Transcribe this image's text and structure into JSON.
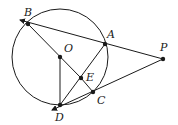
{
  "diagram": {
    "type": "geometry",
    "stroke_color": "#1a1a1a",
    "points": [
      {
        "id": "B",
        "label": "B",
        "x": 28,
        "y": 24,
        "lx": 24,
        "ly": 16
      },
      {
        "id": "O",
        "label": "O",
        "x": 60,
        "y": 57,
        "lx": 64,
        "ly": 52
      },
      {
        "id": "A",
        "label": "A",
        "x": 105,
        "y": 44,
        "lx": 107,
        "ly": 36
      },
      {
        "id": "P",
        "label": "P",
        "x": 163,
        "y": 59,
        "lx": 160,
        "ly": 50
      },
      {
        "id": "E",
        "label": "E",
        "x": 81,
        "y": 78,
        "lx": 87,
        "ly": 80
      },
      {
        "id": "C",
        "label": "C",
        "x": 93,
        "y": 92,
        "lx": 98,
        "ly": 105
      },
      {
        "id": "D",
        "label": "D",
        "x": 60,
        "y": 105,
        "lx": 55,
        "ly": 120
      }
    ],
    "circle": {
      "center": "O",
      "cx": 60,
      "cy": 57,
      "r": 48
    },
    "segments": [
      [
        "B",
        "P"
      ],
      [
        "D",
        "P"
      ],
      [
        "B",
        "D"
      ],
      [
        "O",
        "D"
      ],
      [
        "A",
        "D"
      ],
      [
        "E",
        "C"
      ]
    ],
    "arrows": [
      "from P past B",
      "from P past D"
    ]
  }
}
